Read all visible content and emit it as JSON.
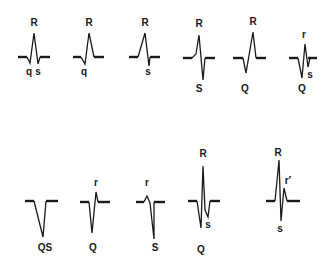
{
  "colors": {
    "ink": "#1a1a1a",
    "background": "#ffffff"
  },
  "complexes": [
    {
      "name": "qRs",
      "baseline_left": [
        18,
        57,
        27,
        57
      ],
      "baseline_right": [
        40,
        57,
        50,
        57
      ],
      "path": "M27,57 L30,63 L34,33 L38,64 L40,57",
      "labels": [
        {
          "text": "R",
          "x": 34,
          "y": 26
        },
        {
          "text": "q",
          "x": 29,
          "y": 75
        },
        {
          "text": "s",
          "x": 38,
          "y": 75
        }
      ]
    },
    {
      "name": "qR",
      "baseline_left": [
        73,
        57,
        81,
        57
      ],
      "baseline_right": [
        94,
        57,
        104,
        57
      ],
      "path": "M81,57 L85,64 L89,33 L94,57",
      "labels": [
        {
          "text": "R",
          "x": 89,
          "y": 26
        },
        {
          "text": "q",
          "x": 84,
          "y": 75
        }
      ]
    },
    {
      "name": "Rs",
      "baseline_left": [
        129,
        57,
        138,
        57
      ],
      "baseline_right": [
        150,
        57,
        160,
        57
      ],
      "path": "M138,57 L145,33 L149,66 L150,57",
      "labels": [
        {
          "text": "R",
          "x": 145,
          "y": 26
        },
        {
          "text": "s",
          "x": 148,
          "y": 75
        }
      ]
    },
    {
      "name": "RS",
      "baseline_left": [
        183,
        58,
        192,
        58
      ],
      "baseline_right": [
        205,
        58,
        215,
        58
      ],
      "path": "M192,58 L196,54 L199,35 L203,80 L205,58",
      "labels": [
        {
          "text": "R",
          "x": 199,
          "y": 27
        },
        {
          "text": "S",
          "x": 199,
          "y": 92
        }
      ]
    },
    {
      "name": "QR",
      "baseline_left": [
        233,
        58,
        243,
        58
      ],
      "baseline_right": [
        256,
        58,
        266,
        58
      ],
      "path": "M243,58 L246,73 L253,32 L256,58",
      "labels": [
        {
          "text": "R",
          "x": 253,
          "y": 25
        },
        {
          "text": "Q",
          "x": 245,
          "y": 92
        }
      ]
    },
    {
      "name": "Qrs",
      "baseline_left": [
        289,
        58,
        298,
        58
      ],
      "baseline_right": [
        308,
        58,
        317,
        58
      ],
      "path": "M298,58 L302,78 L305,44 L308,67 L310,58",
      "labels": [
        {
          "text": "r",
          "x": 304,
          "y": 38
        },
        {
          "text": "s",
          "x": 310,
          "y": 78
        },
        {
          "text": "Q",
          "x": 302,
          "y": 92
        }
      ]
    },
    {
      "name": "QS",
      "baseline_left": [
        25,
        201,
        34,
        201
      ],
      "baseline_right": [
        46,
        201,
        58,
        201
      ],
      "path": "M34,201 L43,237 L46,201",
      "labels": [
        {
          "text": "QS",
          "x": 45,
          "y": 251
        }
      ]
    },
    {
      "name": "Qr",
      "baseline_left": [
        80,
        202,
        89,
        202
      ],
      "baseline_right": [
        98,
        202,
        110,
        202
      ],
      "path": "M89,202 L92,233 L96,192 L98,202",
      "labels": [
        {
          "text": "r",
          "x": 96,
          "y": 186
        },
        {
          "text": "Q",
          "x": 93,
          "y": 251
        }
      ]
    },
    {
      "name": "rS",
      "baseline_left": [
        136,
        202,
        144,
        202
      ],
      "baseline_right": [
        154,
        202,
        165,
        202
      ],
      "path": "M144,202 L147,196 L150,203 L154,239 L154,202",
      "labels": [
        {
          "text": "r",
          "x": 147,
          "y": 186
        },
        {
          "text": "S",
          "x": 155,
          "y": 251
        }
      ]
    },
    {
      "name": "QRs",
      "baseline_left": [
        188,
        201,
        197,
        201
      ],
      "baseline_right": [
        210,
        201,
        220,
        201
      ],
      "path": "M197,201 L201,228 L203,166 L205,210 L208,217 L210,201",
      "labels": [
        {
          "text": "R",
          "x": 203,
          "y": 157
        },
        {
          "text": "s",
          "x": 208,
          "y": 228
        },
        {
          "text": "Q",
          "x": 201,
          "y": 253
        }
      ]
    },
    {
      "name": "RsR'",
      "baseline_left": [
        266,
        201,
        275,
        201
      ],
      "baseline_right": [
        287,
        201,
        300,
        201
      ],
      "path": "M275,201 L279,160 L281,221 L284,188 L287,201",
      "labels": [
        {
          "text": "R",
          "x": 278,
          "y": 156
        },
        {
          "text": "r′",
          "x": 288,
          "y": 184
        },
        {
          "text": "s",
          "x": 280,
          "y": 232
        }
      ]
    }
  ]
}
